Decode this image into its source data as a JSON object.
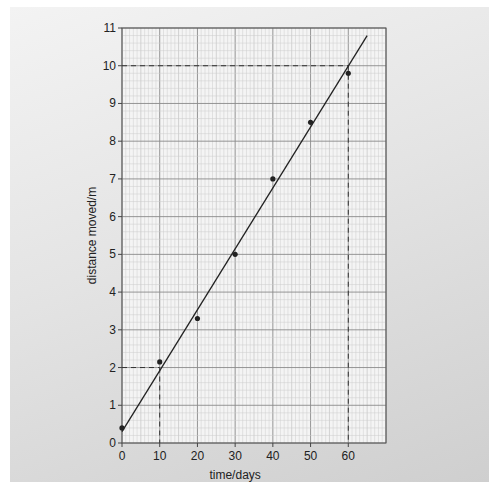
{
  "chart_data": {
    "type": "scatter",
    "title": "",
    "xlabel": "time/days",
    "ylabel": "distance moved/m",
    "xlim": [
      0,
      70
    ],
    "ylim": [
      0,
      11
    ],
    "x_ticks": [
      0,
      10,
      20,
      30,
      40,
      50,
      60
    ],
    "y_ticks": [
      0,
      1,
      2,
      3,
      4,
      5,
      6,
      7,
      8,
      9,
      10,
      11
    ],
    "grid": true,
    "series": [
      {
        "name": "measured points",
        "x": [
          0,
          10,
          20,
          30,
          40,
          50,
          60
        ],
        "y": [
          0.4,
          2.15,
          3.3,
          5.0,
          7.0,
          8.5,
          9.8
        ]
      }
    ],
    "fit_line": {
      "x": [
        0,
        65
      ],
      "y": [
        0.3,
        10.8
      ]
    },
    "annotations": [
      {
        "type": "dashed-guide",
        "x": 10,
        "y": 2
      },
      {
        "type": "dashed-guide",
        "x": 60,
        "y": 10
      }
    ]
  }
}
